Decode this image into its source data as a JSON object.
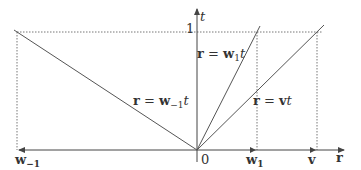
{
  "diagram": {
    "axes": {
      "horizontal": {
        "label": "r",
        "origin_label": "0"
      },
      "vertical": {
        "label": "t",
        "tick_label": "1"
      }
    },
    "ticks": {
      "w_minus_1": {
        "base": "w",
        "sub": "−1"
      },
      "w_1": {
        "base": "w",
        "sub": "1"
      },
      "v": {
        "base": "v"
      }
    },
    "lines": {
      "w1": {
        "lhs": "r",
        "eq": " = ",
        "base": "w",
        "sub": "1",
        "var": "t"
      },
      "w_minus_1": {
        "lhs": "r",
        "eq": " = ",
        "base": "w",
        "sub": "−1",
        "var": "t"
      },
      "v": {
        "lhs": "r",
        "eq": " = ",
        "base": "v",
        "var": "t"
      }
    },
    "colors": {
      "line": "#555555",
      "dotted": "#777777",
      "text": "#333333"
    }
  }
}
